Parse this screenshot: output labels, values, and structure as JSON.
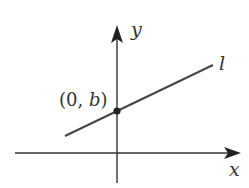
{
  "diagram": {
    "type": "coordinate-line",
    "axes": {
      "x_label": "x",
      "y_label": "y"
    },
    "line": {
      "label": "l",
      "description": "line with positive slope crossing y-axis above origin"
    },
    "point": {
      "label_open": "(0, ",
      "label_var": "b",
      "label_close": ")",
      "full_label": "(0, b)"
    },
    "colors": {
      "stroke": "#333333",
      "background": "#ffffff"
    }
  }
}
